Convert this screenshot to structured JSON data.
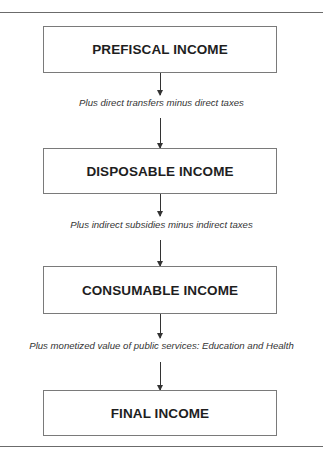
{
  "diagram": {
    "type": "flowchart",
    "direction": "top-to-bottom",
    "nodes": [
      {
        "id": "prefiscal",
        "label": "PREFISCAL INCOME"
      },
      {
        "id": "disposable",
        "label": "DISPOSABLE INCOME"
      },
      {
        "id": "consumable",
        "label": "CONSUMABLE INCOME"
      },
      {
        "id": "final",
        "label": "FINAL INCOME"
      }
    ],
    "edges": [
      {
        "from": "prefiscal",
        "to": "disposable",
        "label": "Plus direct transfers minus direct taxes"
      },
      {
        "from": "disposable",
        "to": "consumable",
        "label": "Plus indirect subsidies minus indirect taxes"
      },
      {
        "from": "consumable",
        "to": "final",
        "label": "Plus monetized value of public services: Education and Health"
      }
    ]
  },
  "colors": {
    "line": "#333333",
    "box_border": "#7a7a7a",
    "text": "#1e1e1e",
    "background": "#ffffff"
  }
}
